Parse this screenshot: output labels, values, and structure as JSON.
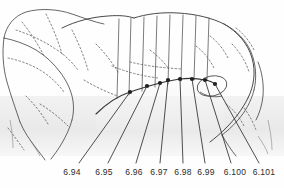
{
  "figure": {
    "kind": "scanned-line-drawing",
    "background_color": "#fefefe",
    "ink_color": "#3a3a3a",
    "shade_band_color": "#ededed",
    "width": 284,
    "height": 188
  },
  "callouts": {
    "labels": [
      {
        "text": "6.94",
        "x": 72,
        "y": 173,
        "leader_from_x": 130,
        "leader_from_y": 92,
        "leader_to_x": 79,
        "leader_to_y": 163
      },
      {
        "text": "6.95",
        "x": 104,
        "y": 173,
        "leader_from_x": 147,
        "leader_from_y": 86,
        "leader_to_x": 108,
        "leader_to_y": 163
      },
      {
        "text": "6.96",
        "x": 134,
        "y": 173,
        "leader_from_x": 160,
        "leader_from_y": 83,
        "leader_to_x": 136,
        "leader_to_y": 163
      },
      {
        "text": "6.97",
        "x": 159,
        "y": 173,
        "leader_from_x": 168,
        "leader_from_y": 80,
        "leader_to_x": 160,
        "leader_to_y": 163
      },
      {
        "text": "6.98",
        "x": 183,
        "y": 173,
        "leader_from_x": 180,
        "leader_from_y": 79,
        "leader_to_x": 183,
        "leader_to_y": 163
      },
      {
        "text": "6.99",
        "x": 206,
        "y": 173,
        "leader_from_x": 192,
        "leader_from_y": 79,
        "leader_to_x": 205,
        "leader_to_y": 163
      },
      {
        "text": "6.100",
        "x": 235,
        "y": 173,
        "leader_from_x": 205,
        "leader_from_y": 80,
        "leader_to_x": 231,
        "leader_to_y": 163
      },
      {
        "text": "6.101",
        "x": 264,
        "y": 173,
        "leader_from_x": 215,
        "leader_from_y": 84,
        "leader_to_x": 259,
        "leader_to_y": 163
      }
    ]
  },
  "landmarks": [
    {
      "x": 130,
      "y": 92
    },
    {
      "x": 147,
      "y": 86
    },
    {
      "x": 160,
      "y": 83
    },
    {
      "x": 168,
      "y": 80
    },
    {
      "x": 180,
      "y": 79
    },
    {
      "x": 192,
      "y": 79
    },
    {
      "x": 205,
      "y": 80
    },
    {
      "x": 215,
      "y": 84
    }
  ],
  "section_lines": [
    {
      "x_top": 119,
      "y_top": 19,
      "x_bottom": 117,
      "y_bottom": 98
    },
    {
      "x_top": 131,
      "y_top": 18,
      "x_bottom": 129,
      "y_bottom": 95
    },
    {
      "x_top": 144,
      "y_top": 17,
      "x_bottom": 142,
      "y_bottom": 91
    },
    {
      "x_top": 157,
      "y_top": 16,
      "x_bottom": 155,
      "y_bottom": 87
    },
    {
      "x_top": 170,
      "y_top": 15,
      "x_bottom": 168,
      "y_bottom": 84
    },
    {
      "x_top": 183,
      "y_top": 15,
      "x_bottom": 181,
      "y_bottom": 81
    },
    {
      "x_top": 196,
      "y_top": 16,
      "x_bottom": 194,
      "y_bottom": 80
    },
    {
      "x_top": 209,
      "y_top": 18,
      "x_bottom": 207,
      "y_bottom": 80
    }
  ]
}
